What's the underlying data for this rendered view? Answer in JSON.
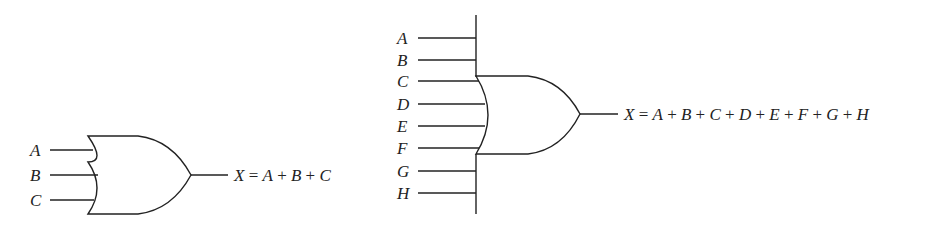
{
  "diagrams": [
    {
      "name": "or-gate-3-input",
      "inputs": [
        "A",
        "B",
        "C"
      ],
      "output_var": "X",
      "expression": "X = A + B + C"
    },
    {
      "name": "or-gate-8-input",
      "inputs": [
        "A",
        "B",
        "C",
        "D",
        "E",
        "F",
        "G",
        "H"
      ],
      "output_var": "X",
      "expression": "X = A + B + C + D + E + F + G + H"
    }
  ],
  "colors": {
    "ink": "#222222",
    "background": "#ffffff"
  }
}
